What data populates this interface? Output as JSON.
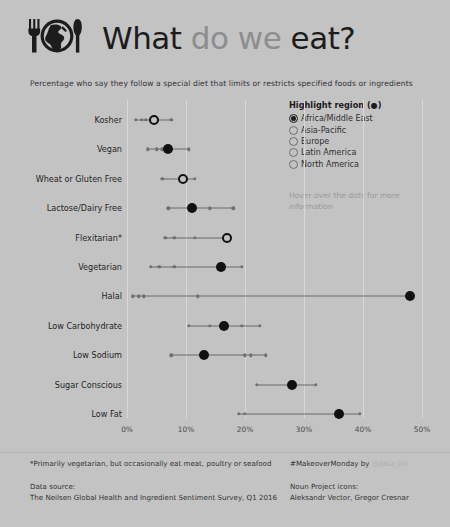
{
  "header": {
    "title_parts": [
      {
        "text": "What ",
        "tone": "dark"
      },
      {
        "text": "do we ",
        "tone": "gray"
      },
      {
        "text": "eat?",
        "tone": "dark"
      }
    ],
    "title_plain": "What do we eat?",
    "icon": "fork-globe-knife-icon"
  },
  "subtitle": "Percentage who say they follow a special diet that limits or restricts specified foods or ingredients",
  "legend": {
    "title": "Highlight region (",
    "title_glyph": "●",
    "title_suffix": ")",
    "options": [
      {
        "label": "Africa/Middle East",
        "selected": true
      },
      {
        "label": "Asia-Pacific",
        "selected": false
      },
      {
        "label": "Europe",
        "selected": false
      },
      {
        "label": "Latin America",
        "selected": false
      },
      {
        "label": "North America",
        "selected": false
      }
    ],
    "hover_note": "Hover over the dots for more information"
  },
  "footer": {
    "footnote": "*Primarily vegetarian, but occasionally eat meat, poultry or seafood",
    "source_label": "Data source:",
    "source_value": "The Neilsen Global Health and Ingredient Sentiment Survey, Q1 2016",
    "makeover_prefix": "#MakeoverMonday by ",
    "makeover_handle": "@data_ish",
    "noun_label": "Noun Project icons:",
    "noun_value": "Aleksandr Vector, Gregor Cresnar"
  },
  "colors": {
    "background": "#c3c3c3",
    "highlight": "#111111",
    "other_dot": "#6f6f6f",
    "connector": "#6b6b6b",
    "grid": "#d8d8d8",
    "title_dark": "#1c1c1c",
    "title_gray": "#8d8d8d"
  },
  "chart_data": {
    "type": "scatter",
    "title": "What do we eat?",
    "subtitle": "Percentage who say they follow a special diet that limits or restricts specified foods or ingredients",
    "xlabel": "",
    "ylabel": "",
    "xlim": [
      0,
      50
    ],
    "xticks": [
      0,
      10,
      20,
      30,
      40,
      50
    ],
    "xtick_labels": [
      "0%",
      "10%",
      "20%",
      "30%",
      "40%",
      "50%"
    ],
    "grid": true,
    "legend_position": "top-right",
    "highlight_series": "Africa/Middle East",
    "series_names": [
      "Africa/Middle East",
      "Asia-Pacific",
      "Europe",
      "Latin America",
      "North America"
    ],
    "categories": [
      "Kosher",
      "Vegan",
      "Wheat or Gluten Free",
      "Lactose/Dairy Free",
      "Flexitarian*",
      "Vegetarian",
      "Halal",
      "Low Carbohydrate",
      "Low Sodium",
      "Sugar Conscious",
      "Low Fat"
    ],
    "rows": [
      {
        "category": "Kosher",
        "highlight": 4.5,
        "highlight_style": "ring",
        "others": [
          1.5,
          2.5,
          3.2,
          7.5
        ]
      },
      {
        "category": "Vegan",
        "highlight": 7.0,
        "highlight_style": "filled",
        "others": [
          3.5,
          5.0,
          6.0,
          10.5
        ]
      },
      {
        "category": "Wheat or Gluten Free",
        "highlight": 9.5,
        "highlight_style": "ring",
        "others": [
          6.0,
          11.5
        ]
      },
      {
        "category": "Lactose/Dairy Free",
        "highlight": 11.0,
        "highlight_style": "filled",
        "others": [
          7.0,
          14.0,
          18.0
        ]
      },
      {
        "category": "Flexitarian*",
        "highlight": 17.0,
        "highlight_style": "ring",
        "others": [
          6.5,
          8.0,
          11.5
        ]
      },
      {
        "category": "Vegetarian",
        "highlight": 16.0,
        "highlight_style": "filled",
        "others": [
          4.0,
          5.5,
          8.0,
          19.5
        ]
      },
      {
        "category": "Halal",
        "highlight": 48.0,
        "highlight_style": "filled",
        "others": [
          1.0,
          2.0,
          2.8,
          12.0
        ]
      },
      {
        "category": "Low Carbohydrate",
        "highlight": 16.5,
        "highlight_style": "filled",
        "others": [
          10.5,
          14.0,
          19.5,
          22.5
        ]
      },
      {
        "category": "Low Sodium",
        "highlight": 13.0,
        "highlight_style": "filled",
        "others": [
          7.5,
          20.0,
          21.0,
          23.5
        ]
      },
      {
        "category": "Sugar Conscious",
        "highlight": 28.0,
        "highlight_style": "filled",
        "others": [
          22.0,
          32.0
        ]
      },
      {
        "category": "Low Fat",
        "highlight": 36.0,
        "highlight_style": "filled",
        "others": [
          19.0,
          20.0,
          39.5
        ]
      }
    ]
  },
  "geometry": {
    "x0_px": 127,
    "x_per_unit_px": 5.9,
    "row_top_px": 120,
    "row_step_px": 29.4,
    "grid_top_px": 100,
    "grid_bottom_px": 418,
    "axis_label_y_px": 425
  }
}
